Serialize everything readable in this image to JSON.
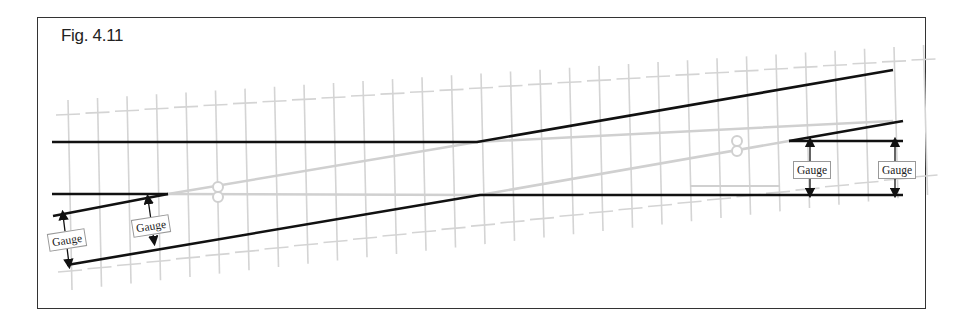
{
  "figure": {
    "label": "Fig. 4.11",
    "gauge_label": "Gauge",
    "colors": {
      "rail": "#111111",
      "sleeper": "#d4d4d4",
      "ghost": "#d0d0d0",
      "frame": "#333333"
    }
  },
  "gauges": [
    {
      "id": "left-1",
      "label": "Gauge",
      "x": 48,
      "y": 231,
      "rotate": -9
    },
    {
      "id": "left-2",
      "label": "Gauge",
      "x": 132,
      "y": 217,
      "rotate": -9
    },
    {
      "id": "right-1",
      "label": "Gauge",
      "x": 793,
      "y": 161,
      "rotate": 0
    },
    {
      "id": "right-2",
      "label": "Gauge",
      "x": 878,
      "y": 161,
      "rotate": 0
    }
  ],
  "rails": [
    {
      "id": "main-top",
      "points": "52,142 477,142 893,70"
    },
    {
      "id": "main-bottom",
      "points": "67,265 480,195 903,195"
    },
    {
      "id": "left-short",
      "points": "52,194 168,194"
    },
    {
      "id": "left-wing",
      "points": "53,216 168,194"
    },
    {
      "id": "right-short",
      "points": "789,141 903,141"
    },
    {
      "id": "right-wing",
      "points": "789,141 903,121"
    }
  ],
  "arrows": [
    {
      "x1": 63,
      "y1": 215,
      "x2": 69,
      "y2": 264
    },
    {
      "x1": 148,
      "y1": 199,
      "x2": 154,
      "y2": 241
    },
    {
      "x1": 810,
      "y1": 142,
      "x2": 810,
      "y2": 193
    },
    {
      "x1": 895,
      "y1": 142,
      "x2": 895,
      "y2": 193
    }
  ],
  "frogs": [
    {
      "x": 218,
      "y": 192
    },
    {
      "x": 737,
      "y": 146
    }
  ]
}
